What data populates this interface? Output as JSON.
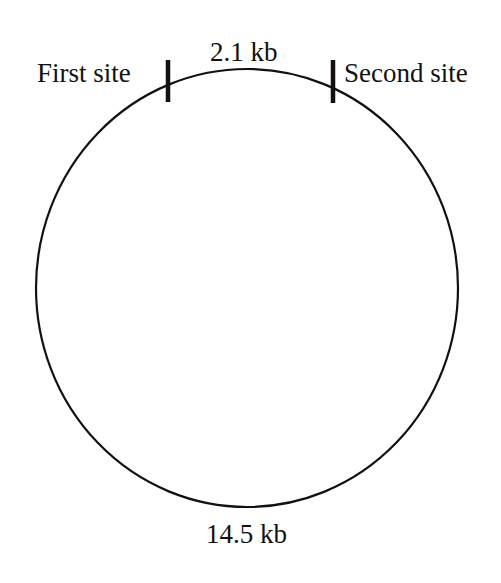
{
  "diagram": {
    "type": "plasmid-restriction-map",
    "labels": {
      "first_site": "First site",
      "second_site": "Second site",
      "small_fragment": "2.1 kb",
      "large_fragment": "14.5 kb"
    },
    "colors": {
      "line": "#111111",
      "background": "#ffffff"
    }
  }
}
